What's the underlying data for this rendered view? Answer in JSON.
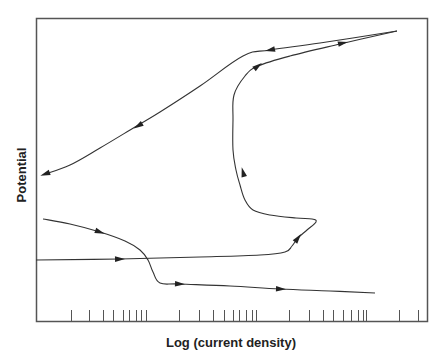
{
  "chart_data": {
    "type": "line",
    "title": "",
    "xlabel": "Log (current density)",
    "ylabel": "Potential",
    "x_scale": "log",
    "x_tick_labels": [],
    "y_tick_labels": [],
    "grid": false,
    "legend": null,
    "series": [
      {
        "name": "cathodic-branch",
        "direction": "forward",
        "points_px": [
          [
            43,
            219
          ],
          [
            70,
            224
          ],
          [
            100,
            232
          ],
          [
            125,
            241
          ],
          [
            140,
            250
          ],
          [
            148,
            260
          ],
          [
            153,
            272
          ],
          [
            160,
            283
          ],
          [
            180,
            284
          ],
          [
            230,
            286
          ],
          [
            280,
            289
          ],
          [
            330,
            291
          ],
          [
            375,
            293
          ]
        ],
        "arrows_px": [
          [
            100,
            232
          ],
          [
            180,
            284
          ],
          [
            281,
            289
          ]
        ]
      },
      {
        "name": "anodic-forward-scan",
        "direction": "forward",
        "points_px": [
          [
            36,
            260
          ],
          [
            120,
            259
          ],
          [
            200,
            257
          ],
          [
            260,
            255
          ],
          [
            285,
            252
          ],
          [
            292,
            246
          ],
          [
            298,
            238
          ],
          [
            307,
            230
          ],
          [
            316,
            222
          ],
          [
            312,
            219
          ],
          [
            296,
            218
          ],
          [
            270,
            215
          ],
          [
            253,
            210
          ],
          [
            245,
            200
          ],
          [
            240,
            185
          ],
          [
            236,
            170
          ],
          [
            233,
            150
          ],
          [
            233,
            120
          ],
          [
            234,
            95
          ],
          [
            245,
            76
          ],
          [
            258,
            66
          ],
          [
            290,
            56
          ],
          [
            340,
            44
          ],
          [
            397,
            31
          ]
        ],
        "arrows_px": [
          [
            120,
            259
          ],
          [
            298,
            238
          ],
          [
            243,
            172
          ],
          [
            258,
            66
          ],
          [
            343,
            43
          ]
        ]
      },
      {
        "name": "reverse-scan",
        "direction": "reverse",
        "points_px": [
          [
            397,
            31
          ],
          [
            320,
            43
          ],
          [
            270,
            50
          ],
          [
            243,
            56
          ],
          [
            200,
            86
          ],
          [
            160,
            112
          ],
          [
            135,
            127
          ],
          [
            100,
            148
          ],
          [
            70,
            165
          ],
          [
            45,
            174
          ]
        ],
        "arrows_px": [
          [
            270,
            50
          ],
          [
            138,
            126
          ],
          [
            45,
            174
          ]
        ]
      }
    ],
    "x_ticks_px": [
      71,
      89,
      103,
      113,
      123,
      129,
      136,
      141,
      146,
      179,
      199,
      213,
      224,
      233,
      239,
      246,
      252,
      256,
      289,
      309,
      323,
      333,
      343,
      351,
      358,
      363,
      366,
      399,
      418
    ]
  },
  "colors": {
    "line": "#333333",
    "frame": "#555555",
    "text": "#222222"
  }
}
